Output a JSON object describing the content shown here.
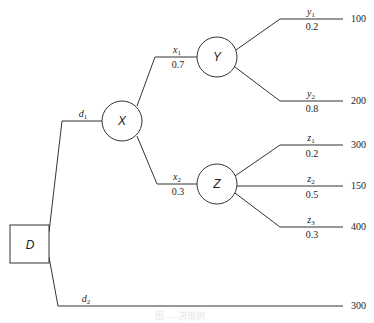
{
  "diagram": {
    "type": "decision-tree",
    "nodes": {
      "decision": {
        "label": "D"
      },
      "chance_x": {
        "label": "X"
      },
      "chance_y": {
        "label": "Y"
      },
      "chance_z": {
        "label": "Z"
      }
    },
    "branches": {
      "d1": {
        "base": "d",
        "sub": "1"
      },
      "d2": {
        "base": "d",
        "sub": "2"
      },
      "x1": {
        "base": "x",
        "sub": "1",
        "prob": "0.7"
      },
      "x2": {
        "base": "x",
        "sub": "2",
        "prob": "0.3"
      },
      "y1": {
        "base": "y",
        "sub": "1",
        "prob": "0.2",
        "payoff": "100"
      },
      "y2": {
        "base": "y",
        "sub": "2",
        "prob": "0.8",
        "payoff": "200"
      },
      "z1": {
        "base": "z",
        "sub": "1",
        "prob": "0.2",
        "payoff": "300"
      },
      "z2": {
        "base": "z",
        "sub": "2",
        "prob": "0.5",
        "payoff": "150"
      },
      "z3": {
        "base": "z",
        "sub": "3",
        "prob": "0.3",
        "payoff": "400"
      },
      "d2_payoff": "300"
    },
    "caption": "图 — 决策树"
  }
}
